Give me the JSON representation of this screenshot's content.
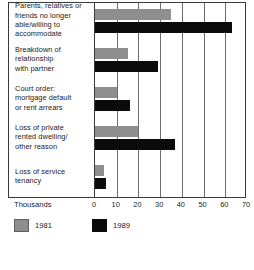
{
  "chart_data": {
    "type": "bar",
    "orientation": "horizontal",
    "title": "",
    "xlabel": "Thousands",
    "ylabel": "",
    "xlim": [
      0,
      70
    ],
    "xticks": [
      0,
      10,
      20,
      30,
      40,
      50,
      60,
      70
    ],
    "grid": "vertical",
    "legend_position": "bottom-left",
    "categories": [
      "Parents, relatives or friends no longer able/willing to accommodate",
      "Breakdown of relationship with partner",
      "Court order: mortgage default or rent arrears",
      "Loss of private rented dwelling/other reason",
      "Loss of service tenancy"
    ],
    "category_lines": [
      [
        "Parents, relatives or",
        "friends no longer",
        "able/willing to",
        "accommodate"
      ],
      [
        "Breakdown of",
        "relationship",
        "with partner"
      ],
      [
        "Court order:",
        "mortgage default",
        "or rent arrears"
      ],
      [
        "Loss of private",
        "rented dwelling/",
        "other reason"
      ],
      [
        "Loss of service",
        "tenancy"
      ]
    ],
    "series": [
      {
        "name": "1981",
        "color": "#8e8e8e",
        "values": [
          35,
          15,
          10,
          20,
          4
        ]
      },
      {
        "name": "1989",
        "color": "#0b0b0b",
        "values": [
          63,
          29,
          16,
          37,
          5
        ]
      }
    ]
  },
  "legend": {
    "items": [
      {
        "label": "1981",
        "color": "#8e8e8e"
      },
      {
        "label": "1989",
        "color": "#0b0b0b"
      }
    ]
  },
  "axis": {
    "title": "Thousands",
    "tick_labels": [
      "0",
      "10",
      "20",
      "30",
      "40",
      "50",
      "60",
      "70"
    ]
  }
}
